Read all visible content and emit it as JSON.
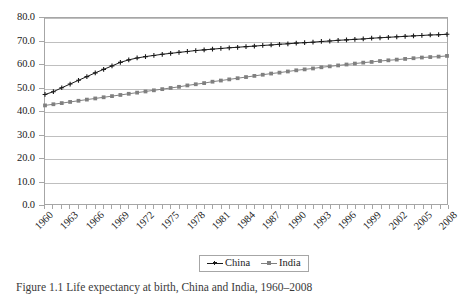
{
  "chart_data": {
    "type": "line",
    "title": "",
    "xlabel": "",
    "ylabel": "",
    "ylim": [
      0.0,
      80.0
    ],
    "ytick_step": 10.0,
    "ytick_labels": [
      "80.0",
      "70.0",
      "60.0",
      "50.0",
      "40.0",
      "30.0",
      "20.0",
      "10.0",
      "0.0"
    ],
    "ytick_values": [
      80.0,
      70.0,
      60.0,
      50.0,
      40.0,
      30.0,
      20.0,
      10.0,
      0.0
    ],
    "grid": true,
    "legend_position": "bottom-center",
    "x": [
      1960,
      1961,
      1962,
      1963,
      1964,
      1965,
      1966,
      1967,
      1968,
      1969,
      1970,
      1971,
      1972,
      1973,
      1974,
      1975,
      1976,
      1977,
      1978,
      1979,
      1980,
      1981,
      1982,
      1983,
      1984,
      1985,
      1986,
      1987,
      1988,
      1989,
      1990,
      1991,
      1992,
      1993,
      1994,
      1995,
      1996,
      1997,
      1998,
      1999,
      2000,
      2001,
      2002,
      2003,
      2004,
      2005,
      2006,
      2007,
      2008
    ],
    "xtick_labels": [
      "1960",
      "1963",
      "1966",
      "1969",
      "1972",
      "1975",
      "1978",
      "1981",
      "1984",
      "1987",
      "1990",
      "1993",
      "1996",
      "1999",
      "2002",
      "2005",
      "2008"
    ],
    "xtick_values": [
      1960,
      1963,
      1966,
      1969,
      1972,
      1975,
      1978,
      1981,
      1984,
      1987,
      1990,
      1993,
      1996,
      1999,
      2002,
      2005,
      2008
    ],
    "xtick_label_rotation_deg": -45,
    "series": [
      {
        "name": "China",
        "color": "#1a1a1a",
        "marker": "plus",
        "values": [
          47.1,
          48.3,
          50.0,
          51.6,
          53.2,
          54.8,
          56.4,
          57.9,
          59.4,
          60.9,
          62.0,
          62.8,
          63.4,
          63.9,
          64.4,
          64.8,
          65.2,
          65.6,
          66.0,
          66.3,
          66.6,
          66.9,
          67.2,
          67.4,
          67.7,
          67.9,
          68.2,
          68.4,
          68.7,
          68.9,
          69.2,
          69.4,
          69.6,
          69.9,
          70.1,
          70.4,
          70.6,
          70.8,
          71.0,
          71.3,
          71.5,
          71.7,
          71.9,
          72.1,
          72.3,
          72.5,
          72.7,
          72.8,
          73.0
        ]
      },
      {
        "name": "India",
        "color": "#808080",
        "marker": "square",
        "values": [
          42.4,
          42.9,
          43.4,
          43.9,
          44.4,
          44.9,
          45.4,
          45.9,
          46.4,
          46.9,
          47.4,
          47.9,
          48.4,
          48.9,
          49.4,
          49.9,
          50.4,
          51.0,
          51.5,
          52.0,
          52.6,
          53.1,
          53.6,
          54.1,
          54.6,
          55.1,
          55.6,
          56.1,
          56.5,
          57.0,
          57.5,
          57.9,
          58.3,
          58.8,
          59.2,
          59.6,
          60.0,
          60.4,
          60.8,
          61.1,
          61.5,
          61.8,
          62.1,
          62.4,
          62.7,
          63.0,
          63.2,
          63.4,
          63.7
        ]
      }
    ]
  },
  "legend": {
    "entries": [
      {
        "label": "China"
      },
      {
        "label": "India"
      }
    ]
  },
  "caption": {
    "text": "Figure 1.1 Life expectancy at birth, China and India, 1960–2008"
  },
  "colors": {
    "china": "#1a1a1a",
    "india": "#808080",
    "gridline": "#bfbfbf",
    "axis": "#a6a6a6",
    "background": "#ffffff"
  }
}
